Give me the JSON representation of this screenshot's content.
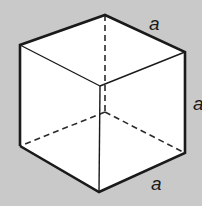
{
  "diagram": {
    "colors": {
      "background": "#c9c9c9",
      "face": "#ffffff",
      "edge": "#1a1a1a"
    },
    "vertices": {
      "top_back": [
        105,
        15
      ],
      "top_left": [
        20,
        45
      ],
      "top_right": [
        185,
        52
      ],
      "top_front": [
        100,
        86
      ],
      "bottom_left": [
        20,
        146
      ],
      "bottom_front": [
        99,
        192
      ],
      "bottom_right": [
        185,
        153
      ],
      "bottom_back": [
        105,
        112
      ]
    },
    "labels": [
      {
        "id": "top-edge",
        "text": "a",
        "x": 149,
        "y": 30
      },
      {
        "id": "right-edge",
        "text": "a",
        "x": 193,
        "y": 110
      },
      {
        "id": "bottom-edge",
        "text": "a",
        "x": 151,
        "y": 190
      }
    ]
  }
}
